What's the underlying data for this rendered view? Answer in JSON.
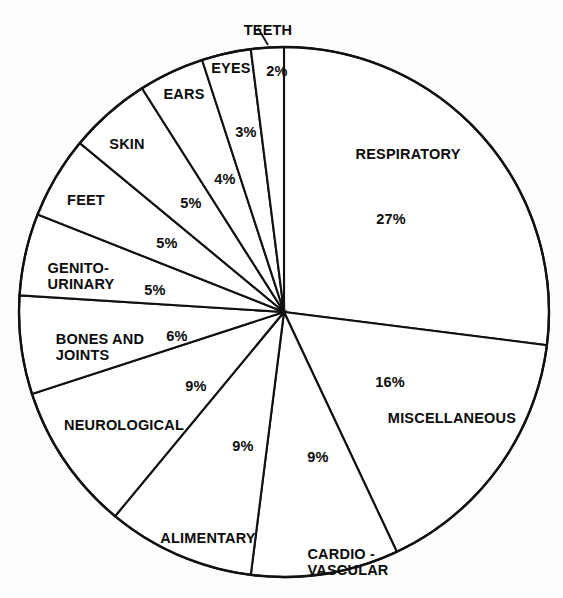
{
  "figure": {
    "background_color": "#fdfdfd",
    "line_color": "#111111",
    "text_color": "#0b0b0b",
    "fill_color": "#ffffff"
  },
  "chart_data": {
    "type": "pie",
    "title": "",
    "subtitle": "",
    "xlabel": "",
    "ylabel": "",
    "legend_position": "none",
    "grid": false,
    "units": "percent",
    "total": 100,
    "start_angle_deg": 0,
    "direction": "clockwise",
    "categories": [
      "RESPIRATORY",
      "MISCELLANEOUS",
      "CARDIO-VASCULAR",
      "ALIMENTARY",
      "NEUROLOGICAL",
      "BONES AND JOINTS",
      "GENITO-URINARY",
      "FEET",
      "SKIN",
      "EARS",
      "EYES",
      "TEETH"
    ],
    "values": [
      27,
      16,
      9,
      9,
      9,
      6,
      5,
      5,
      5,
      4,
      3,
      2
    ],
    "slices": [
      {
        "label": "RESPIRATORY",
        "value": 27,
        "value_text": "27%"
      },
      {
        "label": "MISCELLANEOUS",
        "value": 16,
        "value_text": "16%"
      },
      {
        "label": "CARDIO-VASCULAR",
        "value": 9,
        "value_text": "9%"
      },
      {
        "label": "ALIMENTARY",
        "value": 9,
        "value_text": "9%"
      },
      {
        "label": "NEUROLOGICAL",
        "value": 9,
        "value_text": "9%"
      },
      {
        "label": "BONES AND JOINTS",
        "value": 6,
        "value_text": "6%"
      },
      {
        "label": "GENITO-URINARY",
        "value": 5,
        "value_text": "5%"
      },
      {
        "label": "FEET",
        "value": 5,
        "value_text": "5%"
      },
      {
        "label": "SKIN",
        "value": 5,
        "value_text": "5%"
      },
      {
        "label": "EARS",
        "value": 4,
        "value_text": "4%"
      },
      {
        "label": "EYES",
        "value": 3,
        "value_text": "3%"
      },
      {
        "label": "TEETH",
        "value": 2,
        "value_text": "2%"
      }
    ]
  },
  "labels": {
    "respiratory_name": "RESPIRATORY",
    "respiratory_pct": "27%",
    "miscellaneous_name": "MISCELLANEOUS",
    "miscellaneous_pct": "16%",
    "cardiovascular_name_line1": "CARDIO -",
    "cardiovascular_name_line2": "VASCULAR",
    "cardiovascular_pct": "9%",
    "alimentary_name": "ALIMENTARY",
    "alimentary_pct": "9%",
    "neurological_name": "NEUROLOGICAL",
    "neurological_pct": "9%",
    "bones_name_line1": "BONES AND",
    "bones_name_line2": "JOINTS",
    "bones_pct": "6%",
    "genito_name_line1": "GENITO-",
    "genito_name_line2": "URINARY",
    "genito_pct": "5%",
    "feet_name": "FEET",
    "feet_pct": "5%",
    "skin_name": "SKIN",
    "skin_pct": "5%",
    "ears_name": "EARS",
    "ears_pct": "4%",
    "eyes_name": "EYES",
    "eyes_pct": "3%",
    "teeth_name": "TEETH",
    "teeth_pct": "2%"
  }
}
